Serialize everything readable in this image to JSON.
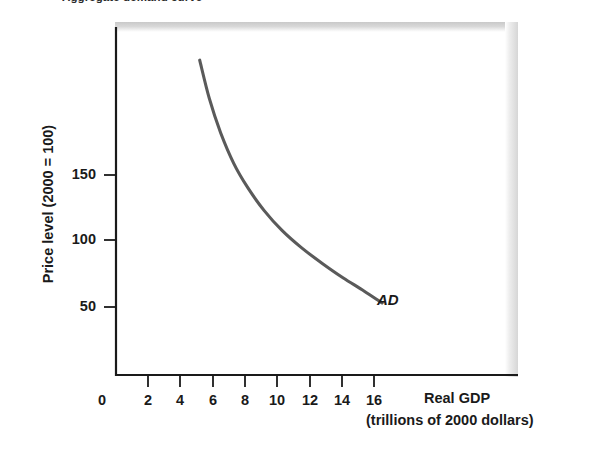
{
  "figure": {
    "title_cut_off": "Aggregate demand curve",
    "curve_label": "AD"
  },
  "chart_data": {
    "type": "line",
    "title": "Aggregate demand curve",
    "xlabel": "Real GDP",
    "xlabel_units": "(trillions of 2000 dollars)",
    "ylabel": "Price level (2000 = 100)",
    "xlim": [
      0,
      18
    ],
    "ylim": [
      0,
      270
    ],
    "grid": false,
    "legend": "none",
    "xticks": [
      0,
      2,
      4,
      6,
      8,
      10,
      12,
      14,
      16
    ],
    "xtick_labels": [
      "0",
      "2",
      "4",
      "6",
      "8",
      "10",
      "12",
      "14",
      "16"
    ],
    "yticks": [
      50,
      100,
      150
    ],
    "ytick_labels": [
      "50",
      "100",
      "150"
    ],
    "series": [
      {
        "name": "AD",
        "label": "AD",
        "color": "#5a5a5a",
        "x": [
          5.2,
          5.8,
          6.5,
          7.3,
          8.2,
          9.2,
          10.3,
          11.5,
          12.8,
          14.1,
          15.4,
          16.5
        ],
        "y": [
          237,
          208,
          182,
          159,
          140,
          123,
          108,
          95,
          83,
          72,
          62,
          53
        ]
      }
    ],
    "annotations": [
      {
        "text": "AD",
        "x": 17.2,
        "y": 48,
        "style": "italic"
      }
    ]
  },
  "axes": {
    "y_title": "Price level (2000 = 100)",
    "x_title": "Real GDP",
    "x_subtitle": "(trillions of 2000 dollars)",
    "origin_label": "0",
    "y_ticks": [
      "150",
      "100",
      "50"
    ],
    "x_ticks": [
      "2",
      "4",
      "6",
      "8",
      "10",
      "12",
      "14",
      "16"
    ]
  },
  "colors": {
    "curve": "#5a5a5a",
    "axis": "#1a1a1a",
    "text": "#1a1a1a",
    "scan_shadow": "#d2d2d2",
    "background": "#ffffff"
  }
}
